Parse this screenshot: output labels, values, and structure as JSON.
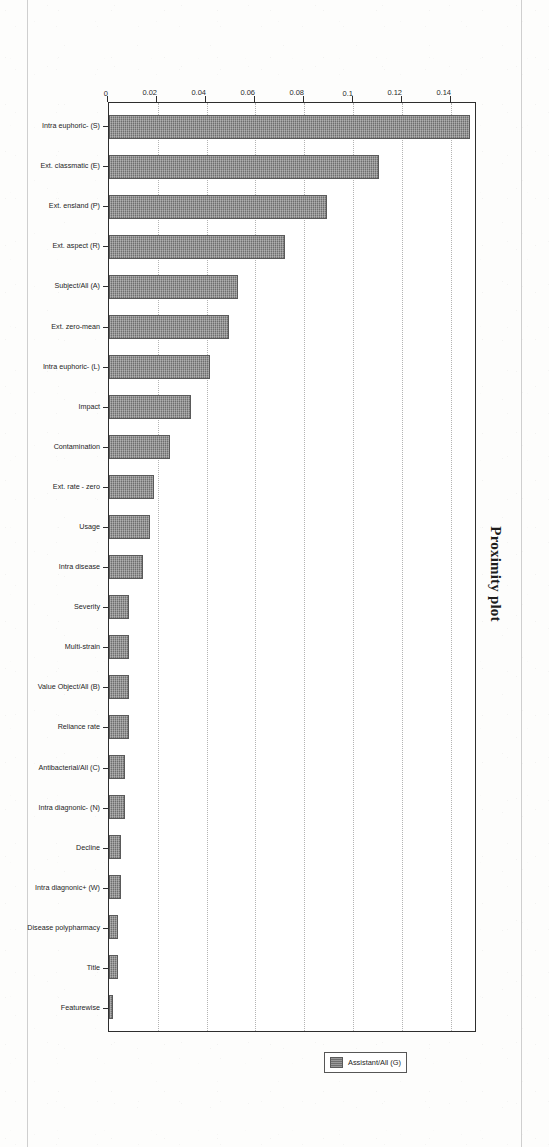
{
  "document": {
    "kind": "scanned-page",
    "page_background": "#fdfdfc"
  },
  "colors": {
    "bar_fill": "#6e6e6e",
    "bar_stroke": "#5a5a5a",
    "frame": "#2e2e2e",
    "gridline": "#b4b4b4",
    "text": "#242424"
  },
  "chart_data": {
    "type": "bar",
    "title": "Proximity plot",
    "orientation": "vertical-bars-on-rotated-page",
    "xlabel": "",
    "ylabel": "",
    "ylim": [
      0,
      0.15
    ],
    "grid": true,
    "legend_position": "right",
    "legend": [
      {
        "name": "Assistant/All (G)",
        "color": "#6e6e6e"
      }
    ],
    "ticks": [
      "0",
      "0.02",
      "0.04",
      "0.06",
      "0.08",
      "0.1",
      "0.12",
      "0.14"
    ],
    "tick_values": [
      0,
      0.02,
      0.04,
      0.06,
      0.08,
      0.1,
      0.12,
      0.14
    ],
    "categories": [
      "Intra euphoric- (S)",
      "Ext. classmatic (E)",
      "Ext. ensland (P)",
      "Ext. aspect (R)",
      "Subject/All (A)",
      "Ext. zero-mean",
      "Intra euphoric- (L)",
      "Impact",
      "Contamination",
      "Ext. rate - zero",
      "Usage",
      "Intra disease",
      "Severity",
      "Multi-strain",
      "Value Object/All (B)",
      "Reliance rate",
      "Antibacterial/All (C)",
      "Intra diagnonic- (N)",
      "Decline",
      "Intra diagnonic+ (W)",
      "Disease polypharmacy",
      "Title",
      "Featurewise"
    ],
    "values": [
      0.148,
      0.1105,
      0.0895,
      0.072,
      0.053,
      0.049,
      0.0415,
      0.0335,
      0.025,
      0.0185,
      0.017,
      0.014,
      0.0083,
      0.0083,
      0.0083,
      0.0083,
      0.0065,
      0.0065,
      0.0048,
      0.0048,
      0.0038,
      0.0038,
      0.0015
    ],
    "series": [
      {
        "name": "Assistant/All (G)",
        "values": [
          0.148,
          0.1105,
          0.0895,
          0.072,
          0.053,
          0.049,
          0.0415,
          0.0335,
          0.025,
          0.0185,
          0.017,
          0.014,
          0.0083,
          0.0083,
          0.0083,
          0.0083,
          0.0065,
          0.0065,
          0.0048,
          0.0048,
          0.0038,
          0.0038,
          0.0015
        ]
      }
    ]
  }
}
